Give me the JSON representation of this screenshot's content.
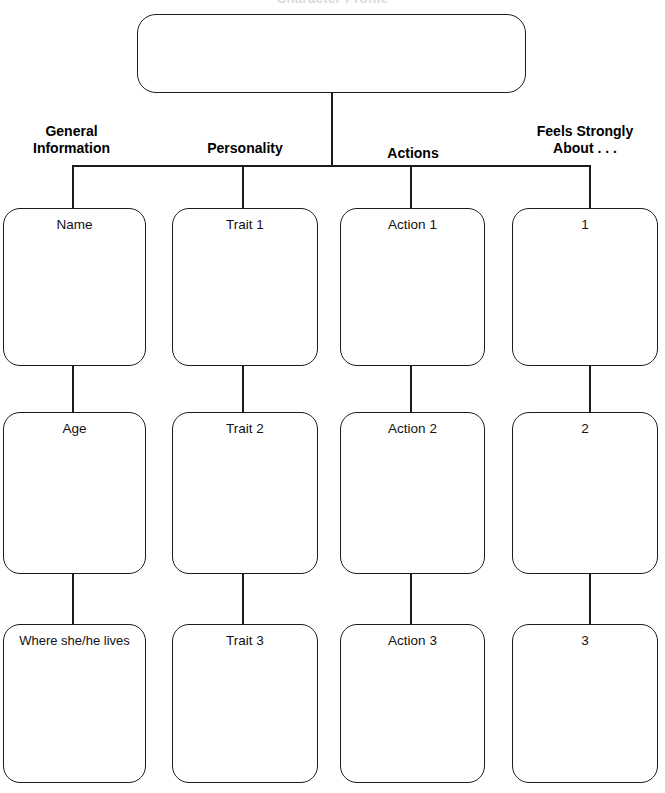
{
  "sheet": {
    "title": "Character Profile",
    "root_box_label": ""
  },
  "columns": [
    {
      "heading": "General\nInformation"
    },
    {
      "heading": "Personality"
    },
    {
      "heading": "Actions"
    },
    {
      "heading": "Feels Strongly\nAbout . . ."
    }
  ],
  "rows": [
    {
      "cells": [
        {
          "label": "Name"
        },
        {
          "label": "Trait 1"
        },
        {
          "label": "Action 1"
        },
        {
          "label": "1"
        }
      ]
    },
    {
      "cells": [
        {
          "label": "Age"
        },
        {
          "label": "Trait 2"
        },
        {
          "label": "Action 2"
        },
        {
          "label": "2"
        }
      ]
    },
    {
      "cells": [
        {
          "label": "Where she/he lives"
        },
        {
          "label": "Trait 3"
        },
        {
          "label": "Action 3"
        },
        {
          "label": "3"
        }
      ]
    }
  ],
  "style": {
    "line_color": "#1c1c1c",
    "text_color": "#111111",
    "background": "#ffffff"
  }
}
